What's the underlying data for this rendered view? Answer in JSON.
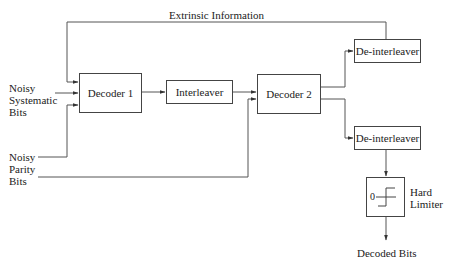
{
  "diagram": {
    "feedback_label": "Extrinsic Information",
    "inputs": {
      "systematic": [
        "Noisy",
        "Systematic",
        "Bits"
      ],
      "parity": [
        "Noisy",
        "Parity",
        "Bits"
      ]
    },
    "blocks": {
      "decoder1": "Decoder 1",
      "interleaver": "Interleaver",
      "decoder2": "Decoder 2",
      "deinterleaver_top": "De-interleaver",
      "deinterleaver_bottom": "De-interleaver",
      "hard_limiter_threshold": "0",
      "hard_limiter_label": [
        "Hard",
        "Limiter"
      ]
    },
    "output_label": "Decoded Bits",
    "colors": {
      "line": "#444444",
      "text": "#222222",
      "background": "#ffffff"
    }
  }
}
